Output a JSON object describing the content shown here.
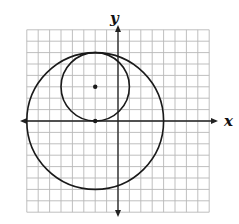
{
  "chart_data": {
    "type": "diagram",
    "title": "",
    "xlabel": "x",
    "ylabel": "y",
    "xlim": [
      -8,
      8
    ],
    "ylim": [
      -8,
      8
    ],
    "grid": true,
    "grid_step": 1,
    "circles": [
      {
        "name": "large-circle",
        "center": [
          -2,
          0
        ],
        "radius": 6
      },
      {
        "name": "small-circle",
        "center": [
          -2,
          3
        ],
        "radius": 3
      }
    ],
    "points": [
      {
        "name": "small-circle-center",
        "x": -2,
        "y": 3
      },
      {
        "name": "large-circle-center",
        "x": -2,
        "y": 0
      }
    ]
  },
  "axes": {
    "x_label": "x",
    "y_label": "y"
  },
  "colors": {
    "grid": "#b8b8b8",
    "axis": "#222222",
    "curve": "#1a1a1a",
    "background": "#ffffff"
  },
  "layout": {
    "origin_px": [
      118,
      121
    ],
    "unit_px": 11.4
  }
}
